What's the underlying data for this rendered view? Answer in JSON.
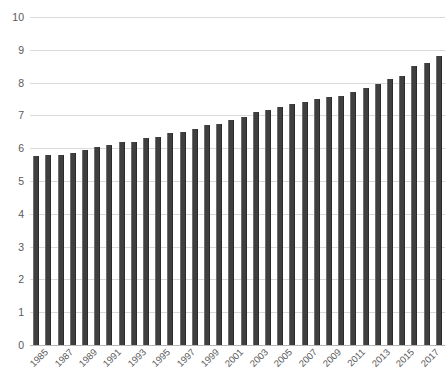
{
  "chart_data": {
    "type": "bar",
    "title": "",
    "subtitle": "",
    "xlabel": "",
    "ylabel": "",
    "ylim": [
      0,
      10
    ],
    "y_ticks": [
      0,
      1,
      2,
      3,
      4,
      5,
      6,
      7,
      8,
      9,
      10
    ],
    "grid": true,
    "legend": false,
    "legend_position": "none",
    "bar_color": "#3f3f3f",
    "gridline_color": "#d9d9d9",
    "axis_label_color": "#5a5a5a",
    "background_color": "#ffffff",
    "x_tick_label_rotation": -45,
    "x_tick_labels_shown": [
      "1985",
      "1987",
      "1989",
      "1991",
      "1993",
      "1995",
      "1997",
      "1999",
      "2001",
      "2003",
      "2005",
      "2007",
      "2009",
      "2011",
      "2013",
      "2015",
      "2017"
    ],
    "categories": [
      "1985",
      "1986",
      "1987",
      "1988",
      "1989",
      "1990",
      "1991",
      "1992",
      "1993",
      "1994",
      "1995",
      "1996",
      "1997",
      "1998",
      "1999",
      "2000",
      "2001",
      "2002",
      "2003",
      "2004",
      "2005",
      "2006",
      "2007",
      "2008",
      "2009",
      "2010",
      "2011",
      "2012",
      "2013",
      "2014",
      "2015",
      "2016",
      "2017",
      "2018"
    ],
    "values": [
      5.75,
      5.8,
      5.8,
      5.85,
      5.95,
      6.05,
      6.1,
      6.2,
      6.2,
      6.3,
      6.35,
      6.45,
      6.5,
      6.6,
      6.7,
      6.75,
      6.85,
      6.95,
      7.1,
      7.15,
      7.25,
      7.35,
      7.4,
      7.5,
      7.55,
      7.6,
      7.7,
      7.85,
      7.95,
      8.1,
      8.2,
      8.5,
      8.6,
      8.8
    ]
  }
}
